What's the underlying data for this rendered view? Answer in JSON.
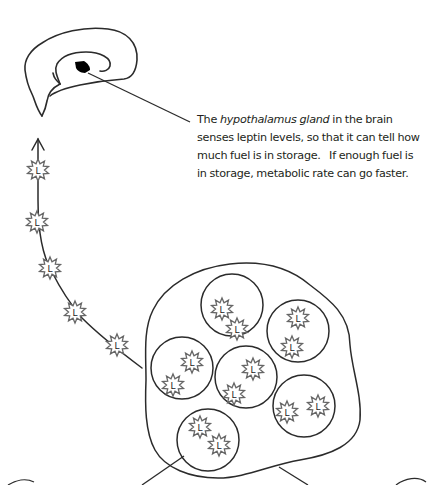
{
  "diagram": {
    "caption": {
      "line1_prefix": "The ",
      "line1_italic": "hypothalamus gland",
      "line1_suffix": " in the brain",
      "line2": "senses leptin levels, so that it can tell how",
      "line3": "much fuel is in storage.   If enough fuel is",
      "line4": "in storage, metabolic rate can go faster."
    },
    "star_label": "L",
    "pathway_stars": [
      {
        "x": 38,
        "y": 170
      },
      {
        "x": 37,
        "y": 222
      },
      {
        "x": 50,
        "y": 268
      },
      {
        "x": 75,
        "y": 312
      },
      {
        "x": 117,
        "y": 345
      }
    ],
    "fat_cells": [
      {
        "cx": 232,
        "cy": 305,
        "r": 31,
        "stars": [
          {
            "x": 222,
            "y": 309
          },
          {
            "x": 237,
            "y": 329
          }
        ]
      },
      {
        "cx": 298,
        "cy": 331,
        "r": 31,
        "stars": [
          {
            "x": 298,
            "y": 318
          },
          {
            "x": 292,
            "y": 347
          }
        ]
      },
      {
        "cx": 182,
        "cy": 368,
        "r": 31,
        "stars": [
          {
            "x": 192,
            "y": 362
          },
          {
            "x": 173,
            "y": 385
          }
        ]
      },
      {
        "cx": 246,
        "cy": 377,
        "r": 31,
        "stars": [
          {
            "x": 253,
            "y": 369
          },
          {
            "x": 234,
            "y": 394
          }
        ]
      },
      {
        "cx": 304,
        "cy": 406,
        "r": 31,
        "stars": [
          {
            "x": 287,
            "y": 412
          },
          {
            "x": 318,
            "y": 406
          }
        ]
      },
      {
        "cx": 208,
        "cy": 440,
        "r": 31,
        "stars": [
          {
            "x": 200,
            "y": 427
          },
          {
            "x": 219,
            "y": 445
          }
        ]
      }
    ],
    "colors": {
      "stroke": "#2b2b2b",
      "star_stroke": "#666666",
      "text": "#231f20",
      "blob": "#000000"
    }
  }
}
